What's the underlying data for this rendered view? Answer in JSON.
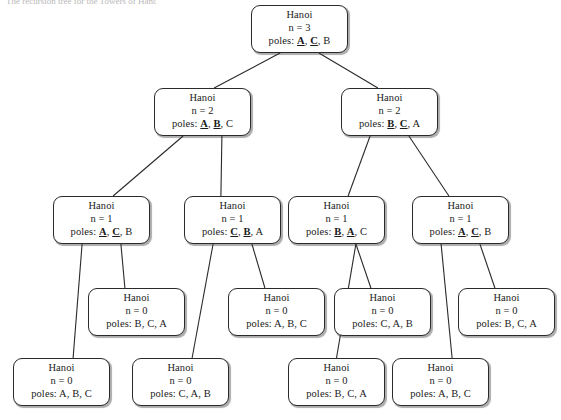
{
  "figure": {
    "caption_fragment": "The recursion tree for the Towers of Hanoi",
    "title_text": "Hanoi",
    "poles_label": "poles:",
    "n_label": "n =",
    "line_color": "#2a2a2a",
    "node_fill": "#ffffff",
    "background": "#ffffff"
  },
  "nodes": [
    {
      "id": "root",
      "title": "Hanoi",
      "n": "n = 3",
      "poles_prefix": "poles: ",
      "poles": [
        {
          "label": "A",
          "highlight": true
        },
        {
          "label": "C",
          "highlight": true
        },
        {
          "label": "B",
          "highlight": false
        }
      ],
      "x": 251,
      "y": 5,
      "w": 97,
      "h": 48
    },
    {
      "id": "level2-left",
      "title": "Hanoi",
      "n": "n = 2",
      "poles_prefix": "poles: ",
      "poles": [
        {
          "label": "A",
          "highlight": true
        },
        {
          "label": "B",
          "highlight": true
        },
        {
          "label": "C",
          "highlight": false
        }
      ],
      "x": 154,
      "y": 88,
      "w": 97,
      "h": 48
    },
    {
      "id": "level2-right",
      "title": "Hanoi",
      "n": "n = 2",
      "poles_prefix": "poles: ",
      "poles": [
        {
          "label": "B",
          "highlight": true
        },
        {
          "label": "C",
          "highlight": true
        },
        {
          "label": "A",
          "highlight": false
        }
      ],
      "x": 341,
      "y": 88,
      "w": 97,
      "h": 48
    },
    {
      "id": "level3-a",
      "title": "Hanoi",
      "n": "n = 1",
      "poles_prefix": "poles: ",
      "poles": [
        {
          "label": "A",
          "highlight": true
        },
        {
          "label": "C",
          "highlight": true
        },
        {
          "label": "B",
          "highlight": false
        }
      ],
      "x": 53,
      "y": 196,
      "w": 97,
      "h": 48
    },
    {
      "id": "level3-b",
      "title": "Hanoi",
      "n": "n = 1",
      "poles_prefix": "poles: ",
      "poles": [
        {
          "label": "C",
          "highlight": true
        },
        {
          "label": "B",
          "highlight": true
        },
        {
          "label": "A",
          "highlight": false
        }
      ],
      "x": 184,
      "y": 196,
      "w": 97,
      "h": 48
    },
    {
      "id": "level3-c",
      "title": "Hanoi",
      "n": "n = 1",
      "poles_prefix": "poles: ",
      "poles": [
        {
          "label": "B",
          "highlight": true
        },
        {
          "label": "A",
          "highlight": true
        },
        {
          "label": "C",
          "highlight": false
        }
      ],
      "x": 288,
      "y": 196,
      "w": 97,
      "h": 48
    },
    {
      "id": "level3-d",
      "title": "Hanoi",
      "n": "n = 1",
      "poles_prefix": "poles: ",
      "poles": [
        {
          "label": "A",
          "highlight": true
        },
        {
          "label": "C",
          "highlight": true
        },
        {
          "label": "B",
          "highlight": false
        }
      ],
      "x": 412,
      "y": 196,
      "w": 97,
      "h": 48
    },
    {
      "id": "leaf-upper-1",
      "title": "Hanoi",
      "n": "n = 0",
      "poles_prefix": "poles: ",
      "poles": [
        {
          "label": "B",
          "highlight": false
        },
        {
          "label": "C",
          "highlight": false
        },
        {
          "label": "A",
          "highlight": false
        }
      ],
      "x": 88,
      "y": 288,
      "w": 97,
      "h": 48
    },
    {
      "id": "leaf-upper-2",
      "title": "Hanoi",
      "n": "n = 0",
      "poles_prefix": "poles: ",
      "poles": [
        {
          "label": "A",
          "highlight": false
        },
        {
          "label": "B",
          "highlight": false
        },
        {
          "label": "C",
          "highlight": false
        }
      ],
      "x": 228,
      "y": 288,
      "w": 97,
      "h": 48
    },
    {
      "id": "leaf-upper-3",
      "title": "Hanoi",
      "n": "n = 0",
      "poles_prefix": "poles: ",
      "poles": [
        {
          "label": "C",
          "highlight": false
        },
        {
          "label": "A",
          "highlight": false
        },
        {
          "label": "B",
          "highlight": false
        }
      ],
      "x": 334,
      "y": 288,
      "w": 97,
      "h": 48
    },
    {
      "id": "leaf-upper-4",
      "title": "Hanoi",
      "n": "n = 0",
      "poles_prefix": "poles: ",
      "poles": [
        {
          "label": "B",
          "highlight": false
        },
        {
          "label": "C",
          "highlight": false
        },
        {
          "label": "A",
          "highlight": false
        }
      ],
      "x": 458,
      "y": 288,
      "w": 97,
      "h": 48
    },
    {
      "id": "leaf-lower-1",
      "title": "Hanoi",
      "n": "n = 0",
      "poles_prefix": "poles: ",
      "poles": [
        {
          "label": "A",
          "highlight": false
        },
        {
          "label": "B",
          "highlight": false
        },
        {
          "label": "C",
          "highlight": false
        }
      ],
      "x": 13,
      "y": 358,
      "w": 97,
      "h": 48
    },
    {
      "id": "leaf-lower-2",
      "title": "Hanoi",
      "n": "n = 0",
      "poles_prefix": "poles: ",
      "poles": [
        {
          "label": "C",
          "highlight": false
        },
        {
          "label": "A",
          "highlight": false
        },
        {
          "label": "B",
          "highlight": false
        }
      ],
      "x": 132,
      "y": 358,
      "w": 97,
      "h": 48
    },
    {
      "id": "leaf-lower-3",
      "title": "Hanoi",
      "n": "n = 0",
      "poles_prefix": "poles: ",
      "poles": [
        {
          "label": "B",
          "highlight": false
        },
        {
          "label": "C",
          "highlight": false
        },
        {
          "label": "A",
          "highlight": false
        }
      ],
      "x": 288,
      "y": 358,
      "w": 97,
      "h": 48
    },
    {
      "id": "leaf-lower-4",
      "title": "Hanoi",
      "n": "n = 0",
      "poles_prefix": "poles: ",
      "poles": [
        {
          "label": "A",
          "highlight": false
        },
        {
          "label": "B",
          "highlight": false
        },
        {
          "label": "C",
          "highlight": false
        }
      ],
      "x": 392,
      "y": 358,
      "w": 97,
      "h": 48
    }
  ],
  "edges": [
    {
      "from": "root",
      "to": "level2-left"
    },
    {
      "from": "root",
      "to": "level2-right"
    },
    {
      "from": "level2-left",
      "to": "level3-a"
    },
    {
      "from": "level2-left",
      "to": "level3-b"
    },
    {
      "from": "level2-right",
      "to": "level3-c"
    },
    {
      "from": "level2-right",
      "to": "level3-d"
    },
    {
      "from": "level3-a",
      "to": "leaf-lower-1"
    },
    {
      "from": "level3-a",
      "to": "leaf-upper-1"
    },
    {
      "from": "level3-b",
      "to": "leaf-lower-2"
    },
    {
      "from": "level3-b",
      "to": "leaf-upper-2"
    },
    {
      "from": "level3-c",
      "to": "leaf-lower-3"
    },
    {
      "from": "level3-c",
      "to": "leaf-upper-3"
    },
    {
      "from": "level3-d",
      "to": "leaf-lower-4"
    },
    {
      "from": "level3-d",
      "to": "leaf-upper-4"
    }
  ]
}
